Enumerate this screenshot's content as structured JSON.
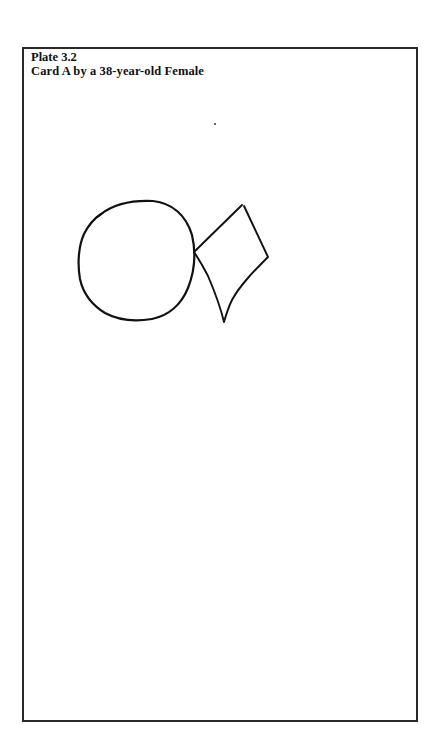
{
  "plate": {
    "label": "Plate 3.2",
    "caption": "Card A by a 38-year-old Female"
  },
  "drawing": {
    "description": "Hand-drawn reproduction of Bender-Gestalt Card A: a circle touching a tilted diamond",
    "stroke_color": "#111111",
    "shapes": [
      {
        "name": "circle",
        "center": [
          137,
          260
        ],
        "approx_radius": 58
      },
      {
        "name": "diamond",
        "vertices": [
          [
            195,
            253
          ],
          [
            243,
            205
          ],
          [
            268,
            257
          ],
          [
            224,
            322
          ]
        ]
      }
    ]
  }
}
